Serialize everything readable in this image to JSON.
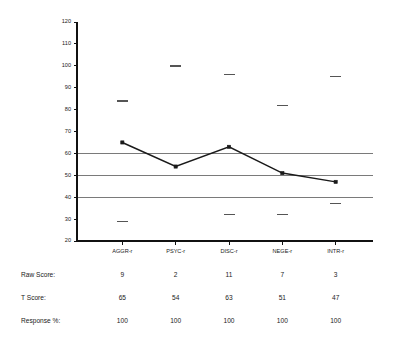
{
  "chart_data": {
    "type": "line",
    "title": "",
    "xlabel": "",
    "ylabel": "",
    "categories": [
      "AGGR-r",
      "PSYC-r",
      "DISC-r",
      "NEGE-r",
      "INTR-r"
    ],
    "values": [
      65,
      54,
      63,
      51,
      47
    ],
    "series": [
      {
        "name": "T Score",
        "values": [
          65,
          54,
          63,
          51,
          47
        ]
      }
    ],
    "ylim": [
      20,
      120
    ],
    "yticks": [
      20,
      30,
      40,
      50,
      60,
      70,
      80,
      90,
      100,
      110,
      120
    ],
    "ytick_labels": [
      "20",
      "30",
      "40",
      "50",
      "60",
      "70",
      "80",
      "90",
      "100",
      "110",
      "120"
    ],
    "reference_lines": [
      40,
      50,
      60
    ],
    "grid": false,
    "legend": "none",
    "range_markers_upper": [
      84,
      100,
      96,
      82,
      95
    ],
    "range_markers_lower": [
      29,
      null,
      32,
      32,
      37
    ]
  },
  "table": {
    "rows": [
      {
        "label": "Raw Score:",
        "name": "raw-score",
        "values": [
          "9",
          "2",
          "11",
          "7",
          "3"
        ]
      },
      {
        "label": "T Score:",
        "name": "t-score",
        "values": [
          "65",
          "54",
          "63",
          "51",
          "47"
        ]
      },
      {
        "label": "Response %:",
        "name": "response-percent",
        "values": [
          "100",
          "100",
          "100",
          "100",
          "100"
        ]
      }
    ]
  },
  "colors": {
    "axis": "#111111",
    "reference_line": "#7a7a7a",
    "series": "#1a1a1a",
    "range_marker": "#555555",
    "background": "#ffffff"
  }
}
